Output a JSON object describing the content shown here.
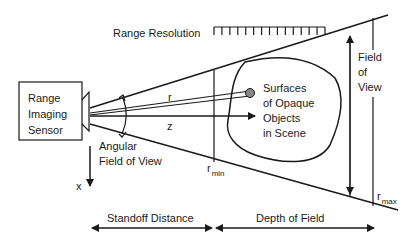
{
  "diagram": {
    "sensor": {
      "line1": "Range",
      "line2": "Imaging",
      "line3": "Sensor"
    },
    "range_resolution": "Range Resolution",
    "ray_label": "r",
    "axis_z": "z",
    "axis_x": "x",
    "angular_fov": {
      "line1": "Angular",
      "line2": "Field of View"
    },
    "object": {
      "line1": "Surfaces",
      "line2": "of Opaque",
      "line3": "Objects",
      "line4": "in Scene"
    },
    "field_of_view": {
      "line1": "Field",
      "line2": "of",
      "line3": "View"
    },
    "r_min": {
      "base": "r",
      "sub": "min"
    },
    "r_max": {
      "base": "r",
      "sub": "max"
    },
    "standoff_distance": "Standoff Distance",
    "depth_of_field": "Depth of Field",
    "range_resolution_ticks": 15
  }
}
